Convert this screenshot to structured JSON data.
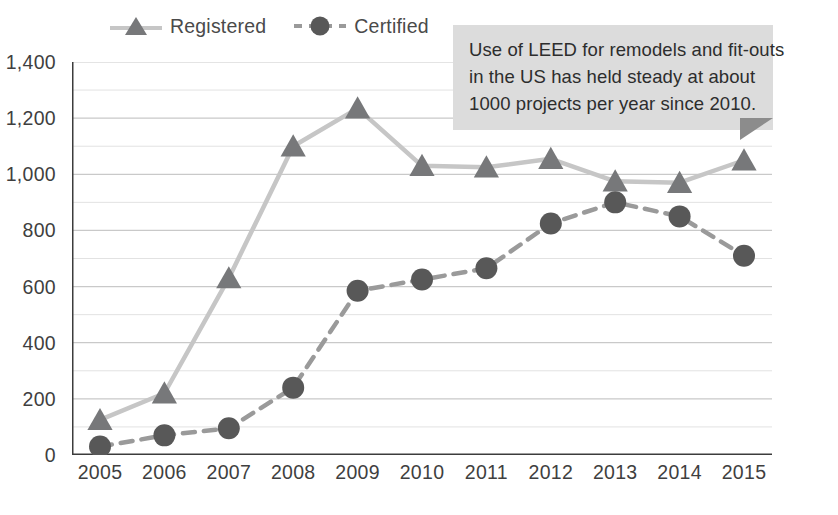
{
  "chart_data": {
    "type": "line",
    "title": "",
    "subtitle": "",
    "xlabel": "",
    "ylabel": "",
    "categories": [
      "2005",
      "2006",
      "2007",
      "2008",
      "2009",
      "2010",
      "2011",
      "2012",
      "2013",
      "2014",
      "2015"
    ],
    "series": [
      {
        "name": "Registered",
        "marker": "triangle",
        "line_style": "solid",
        "line_color": "#c6c6c6",
        "marker_color": "#77787a",
        "values": [
          125,
          220,
          630,
          1100,
          1235,
          1030,
          1025,
          1055,
          975,
          970,
          1050
        ]
      },
      {
        "name": "Certified",
        "marker": "circle",
        "line_style": "dashed",
        "line_color": "#9a9a9a",
        "marker_color": "#585858",
        "values": [
          30,
          70,
          95,
          240,
          585,
          625,
          665,
          825,
          900,
          850,
          710
        ]
      }
    ],
    "ylim": [
      0,
      1400
    ],
    "y_major_ticks": [
      0,
      200,
      400,
      600,
      800,
      1000,
      1200,
      1400
    ],
    "y_major_tick_labels": [
      "0",
      "200",
      "400",
      "600",
      "800",
      "1,000",
      "1,200",
      "1,400"
    ],
    "y_minor_tick_step": 100,
    "grid": true,
    "grid_color": "#d9d9d9",
    "legend_position": "top",
    "annotations": [
      {
        "name": "leed-remodel-callout",
        "lines": [
          "Use of LEED for remodels and fit-outs",
          "in the US has held steady at about",
          "1000 projects per year since 2010."
        ],
        "background": "#dcdcdc",
        "pointer_color": "#8c8c8c"
      }
    ]
  },
  "legend": {
    "entries": [
      {
        "label": "Registered"
      },
      {
        "label": "Certified"
      }
    ]
  }
}
